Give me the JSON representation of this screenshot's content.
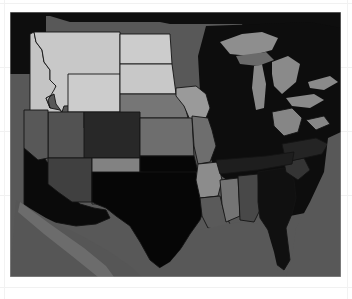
{
  "figure": {
    "type": "choropleth-map",
    "title": "",
    "region": "United States (contiguous)",
    "colormap": "grayscale",
    "background_color": "#ffffff",
    "ocean_color": "#585858",
    "border_color": "#141414",
    "frame": {
      "x": 10,
      "y": 12,
      "width": 331,
      "height": 265
    }
  },
  "legend": {
    "visible": false,
    "entries": []
  },
  "chart_data": {
    "type": "heatmap",
    "title": "",
    "xlabel": "",
    "ylabel": "",
    "grid": false,
    "legend_position": "none",
    "colormap": "gray",
    "value_scale": "darker = higher",
    "categories": [
      "Montana",
      "Idaho",
      "Wyoming",
      "North Dakota",
      "South Dakota",
      "Nebraska",
      "Iowa",
      "Minnesota",
      "Wisconsin",
      "Michigan",
      "Illinois",
      "Indiana",
      "Ohio",
      "Kansas",
      "Missouri",
      "Colorado",
      "Utah",
      "Nevada",
      "California",
      "Arizona",
      "New Mexico",
      "Oklahoma",
      "Texas",
      "Arkansas",
      "Louisiana",
      "Mississippi",
      "Alabama",
      "Tennessee",
      "Kentucky",
      "Georgia",
      "Florida",
      "South Carolina",
      "North Carolina",
      "Virginia",
      "West Virginia",
      "Pennsylvania",
      "New York",
      "Maine",
      "Great Lakes",
      "Gulf of Mexico",
      "Pacific Ocean",
      "Atlantic Ocean",
      "Mexico",
      "Canada"
    ],
    "values": [
      0.88,
      0.86,
      0.9,
      0.9,
      0.88,
      0.55,
      0.7,
      0.06,
      0.06,
      0.06,
      0.08,
      0.1,
      0.12,
      0.5,
      0.5,
      0.16,
      0.36,
      0.36,
      0.04,
      0.26,
      0.6,
      0.03,
      0.03,
      0.66,
      0.38,
      0.56,
      0.3,
      0.12,
      0.12,
      0.06,
      0.04,
      0.2,
      0.14,
      0.14,
      0.62,
      0.1,
      0.07,
      0.07,
      0.44,
      0.36,
      0.36,
      0.36,
      0.34,
      0.04
    ],
    "colors": {
      "Montana": "#c8c8c8",
      "Idaho": "#c4c4c4",
      "Wyoming": "#cccccc",
      "North Dakota": "#cccccc",
      "South Dakota": "#c8c8c8",
      "Nebraska": "#767676",
      "Iowa": "#9a9a9a",
      "Minnesota": "#101010",
      "Wisconsin": "#101010",
      "Michigan": "#0d0d0d",
      "Illinois": "#161616",
      "Indiana": "#1a1a1a",
      "Ohio": "#1e1e1e",
      "Kansas": "#6e6e6e",
      "Missouri": "#6e6e6e",
      "Colorado": "#282828",
      "Utah": "#525252",
      "Nevada": "#585858",
      "California": "#0a0a0a",
      "Arizona": "#404040",
      "New Mexico": "#828282",
      "Oklahoma": "#060606",
      "Texas": "#060606",
      "Arkansas": "#8c8c8c",
      "Louisiana": "#5a5a5a",
      "Mississippi": "#747474",
      "Alabama": "#484848",
      "Tennessee": "#1e1e1e",
      "Kentucky": "#1e1e1e",
      "Georgia": "#101010",
      "Florida": "#0a0a0a",
      "South Carolina": "#343434",
      "North Carolina": "#242424",
      "Virginia": "#242424",
      "West Virginia": "#868686",
      "Pennsylvania": "#1a1a1a",
      "New York": "#121212",
      "Maine": "#121212",
      "Great Lakes": "#6e6e6e",
      "Gulf of Mexico": "#585858",
      "Pacific Ocean": "#585858",
      "Atlantic Ocean": "#585858",
      "Mexico": "#565656",
      "Canada": "#0e0e0e"
    }
  }
}
